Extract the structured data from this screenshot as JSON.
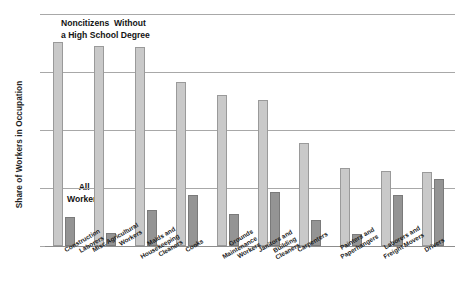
{
  "chart_data": {
    "type": "bar",
    "title": "",
    "subtitle": "",
    "xlabel": "",
    "ylabel": "Share of Workers in Occupation",
    "ylim": [
      0,
      8
    ],
    "ytick_labels": [
      "0%",
      "2%",
      "4%",
      "6%",
      "8%"
    ],
    "ytick_values": [
      0,
      2,
      4,
      6,
      8
    ],
    "grid": true,
    "legend_position": "in-plot-annotations",
    "categories": [
      "Construction\nLaborers",
      "Misc Agricultural\nWorkers",
      "Maids and\nHousekeeping\nCleaners",
      "Cooks",
      "Grounds\nMaintenance\nWorkers",
      "Janitors and\nBuilding\nCleaners",
      "Carpenters",
      "Painters and\nPaperhangers",
      "Laborers and\nFreight Movers",
      "Drivers"
    ],
    "series": [
      {
        "name": "Noncitizens Without a High School Degree",
        "color": "#c9c9c9",
        "values": [
          7.05,
          6.9,
          6.85,
          5.65,
          5.2,
          5.05,
          3.55,
          2.7,
          2.6,
          2.55
        ]
      },
      {
        "name": "All Workers",
        "color": "#949494",
        "values": [
          1.0,
          0.45,
          1.25,
          1.75,
          1.1,
          1.85,
          0.9,
          0.4,
          1.75,
          2.3
        ]
      }
    ],
    "annotations": [
      {
        "id": "noncitizens",
        "text": "Noncitizens  Without\na High School Degree"
      },
      {
        "id": "allworkers",
        "text": "All\nWorkers"
      }
    ]
  }
}
